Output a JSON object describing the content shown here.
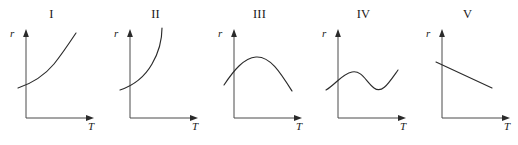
{
  "figure": {
    "background_color": "#ffffff",
    "axis_color": "#4a4a4a",
    "curve_color": "#2b2b2b",
    "width": 518,
    "height": 145
  },
  "panels": [
    {
      "label": "I",
      "y_axis_label": "r",
      "x_axis_label": "T",
      "curve_description": "monotonically increasing, concave up",
      "curve_path": "M 18 88 C 30 84, 44 76, 54 64 C 62 54, 70 42, 76 33"
    },
    {
      "label": "II",
      "y_axis_label": "r",
      "x_axis_label": "T",
      "curve_description": "steeply increasing, near-vertical asymptote",
      "curve_path": "M 16 90 C 28 86, 40 78, 48 64 C 55 52, 58 40, 58 28"
    },
    {
      "label": "III",
      "y_axis_label": "r",
      "x_axis_label": "T",
      "curve_description": "rises to a maximum then falls, inverted parabola",
      "curve_path": "M 16 85 C 26 70, 36 58, 48 57 C 62 56, 72 72, 84 91"
    },
    {
      "label": "IV",
      "y_axis_label": "r",
      "x_axis_label": "T",
      "curve_description": "wavy: rises to local maximum, dips to local minimum, rises again",
      "curve_path": "M 14 90 C 24 84, 30 74, 40 72 C 50 70, 54 82, 62 88 C 70 94, 76 84, 86 70"
    },
    {
      "label": "V",
      "y_axis_label": "r",
      "x_axis_label": "T",
      "curve_description": "straight line decreasing with negative slope",
      "curve_path": "M 20 62 L 76 88"
    }
  ],
  "axes_geometry": {
    "y_axis_top": 32,
    "y_axis_bottom": 118,
    "x_axis_left": 26,
    "x_axis_right": 96
  }
}
